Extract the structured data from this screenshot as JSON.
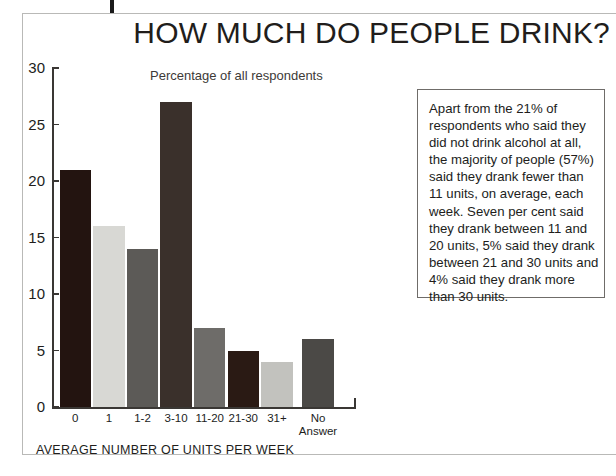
{
  "headline": "HOW MUCH DO PEOPLE DRINK?",
  "note": {
    "text": "Apart from the 21% of respondents who said they did not drink alcohol at all, the majority of people (57%) said they drank fewer than 11 units, on average, each week. Seven per cent said they drank between 11 and 20 units, 5% said they drank between 21 and 30 units and 4% said they drank more than 30 units."
  },
  "chart_data": {
    "type": "bar",
    "title": "HOW MUCH DO PEOPLE DRINK?",
    "subtitle": "Percentage of all respondents",
    "xlabel": "AVERAGE NUMBER OF UNITS PER WEEK",
    "ylabel": "",
    "ylim": [
      0,
      30
    ],
    "yticks": [
      0,
      5,
      10,
      15,
      20,
      25,
      30
    ],
    "ytick_labels": [
      "0",
      "5",
      "10",
      "15",
      "20",
      "25",
      "30"
    ],
    "grid": false,
    "legend": "none",
    "categories": [
      "0",
      "1",
      "1-2",
      "3-10",
      "11-20",
      "21-30",
      "31+",
      "No Answer"
    ],
    "values": [
      21,
      16,
      14,
      27,
      7,
      5,
      4,
      6
    ],
    "bar_colors": [
      "#231410",
      "#d8d8d4",
      "#5c5a57",
      "#3a302b",
      "#6e6c69",
      "#2a1a14",
      "#c2c2be",
      "#4b4946"
    ]
  }
}
